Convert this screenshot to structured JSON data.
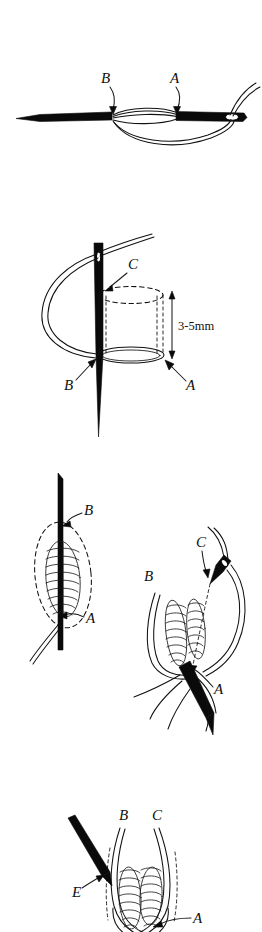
{
  "document": {
    "title": "Suture technique illustration",
    "background_color": "#ffffff",
    "ink_color": "#111111",
    "panel_count": 4
  },
  "panels": [
    {
      "id": "panel-1",
      "name": "needle-with-thread-loops-horizontal",
      "caption": "",
      "labels": [
        {
          "text": "B",
          "role": "callout-label"
        },
        {
          "text": "A",
          "role": "callout-label"
        }
      ]
    },
    {
      "id": "panel-2",
      "name": "vertical-needle-bite-depth",
      "caption": "",
      "labels": [
        {
          "text": "C",
          "role": "callout-label"
        },
        {
          "text": "B",
          "role": "callout-label"
        },
        {
          "text": "A",
          "role": "callout-label"
        }
      ],
      "dimension": {
        "text": "3-5mm",
        "role": "dimension-annotation"
      }
    },
    {
      "id": "panel-3",
      "name": "tissue-pass-two-views",
      "caption": "",
      "subfigures": [
        {
          "id": "panel-3-left",
          "name": "needle-through-tissue-left-view",
          "labels": [
            {
              "text": "B",
              "role": "callout-label"
            },
            {
              "text": "A",
              "role": "callout-label"
            }
          ]
        },
        {
          "id": "panel-3-right",
          "name": "needle-through-tissue-right-view",
          "labels": [
            {
              "text": "C",
              "role": "callout-label"
            },
            {
              "text": "B",
              "role": "callout-label"
            },
            {
              "text": "A",
              "role": "callout-label"
            }
          ]
        }
      ]
    },
    {
      "id": "panel-4",
      "name": "final-loop-placement",
      "caption": "",
      "labels": [
        {
          "text": "B",
          "role": "callout-label"
        },
        {
          "text": "C",
          "role": "callout-label"
        },
        {
          "text": "E",
          "role": "callout-label"
        },
        {
          "text": "A",
          "role": "callout-label"
        }
      ]
    }
  ]
}
